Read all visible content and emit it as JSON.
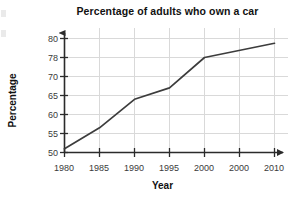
{
  "chart_data": {
    "type": "line",
    "title": "Percentage of adults who own a car",
    "xlabel": "Year",
    "ylabel": "Percentage",
    "grid": true,
    "legend": null,
    "x_tick_labels": [
      "1980",
      "1985",
      "1990",
      "1995",
      "2000",
      "2000",
      "2010"
    ],
    "y_tick_labels": [
      "50",
      "55",
      "60",
      "65",
      "70",
      "78",
      "80"
    ],
    "note_axis": "Y tick labels are evenly spaced on the plot even though their values are not evenly incremented (50,55,60,65,70,78,80); the sixth x tick label reads 2000 where 2005 would be expected.",
    "x": [
      1980,
      1985,
      1990,
      1995,
      2000,
      2010
    ],
    "values": [
      51,
      56.5,
      64,
      67,
      78,
      79.5
    ],
    "series": [
      {
        "name": "Adults who own a car",
        "values": [
          51,
          56.5,
          64,
          67,
          78,
          79.5
        ]
      }
    ],
    "xlim": [
      1980,
      2010
    ],
    "ylim": [
      50,
      80
    ],
    "line_color": "#3c3c3c",
    "grid_color": "#d9d9d9",
    "axis_color": "#2b2b2b"
  }
}
